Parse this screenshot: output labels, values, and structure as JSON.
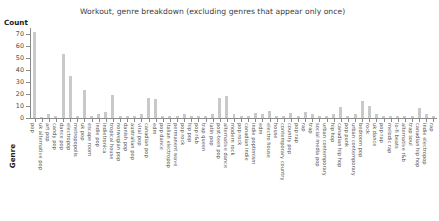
{
  "chart_data": {
    "type": "bar",
    "title": "Workout, genre breakdown (excluding genres that appear only once)",
    "xlabel": "Genre",
    "ylabel": "Count",
    "ylim": [
      0,
      75
    ],
    "yticks": [
      0,
      10,
      20,
      30,
      40,
      50,
      60,
      70
    ],
    "grid": false,
    "legend": null,
    "bar_color": "#c9c9c9",
    "categories": [
      "pop",
      "uk alternative pop",
      "art pop",
      "candy pop",
      "dance pop",
      "electropop",
      "metropopolis",
      "uk pop",
      "escape room",
      "indie pop",
      "indietronica",
      "tropical house",
      "norwegian pop",
      "danish pop",
      "australian pop",
      "viral pop",
      "canadian pop",
      "edm",
      "pop dance",
      "italian electropop",
      "permanent wave",
      "pop rock",
      "hip pop",
      "pop r&b",
      "trap queen",
      "latin pop",
      "post-teen pop",
      "alternative dance",
      "modern rock",
      "pop rock",
      "canadian indie",
      "indie poptimism",
      "edm",
      "electro house",
      "house",
      "contemporary country",
      "country pop",
      "pop rap",
      "rap",
      "trap",
      "social media pop",
      "urban contemporary",
      "hip hop",
      "canadian hip hop",
      "pop punk",
      "urban contemporary",
      "bedroom pop",
      "rock",
      "uk dance",
      "pop rap",
      "melodic rap",
      "lo-fi beats",
      "alternative r&b",
      "trap soul",
      "canadian hip hop",
      "indie electropop",
      "rap"
    ],
    "values": [
      72,
      1,
      3,
      2,
      53,
      35,
      2,
      23,
      2,
      3,
      5,
      19,
      2,
      2,
      2,
      3,
      17,
      16,
      2,
      2,
      2,
      3,
      2,
      2,
      2,
      3,
      17,
      18,
      3,
      2,
      2,
      4,
      3,
      6,
      2,
      2,
      4,
      2,
      5,
      3,
      2,
      2,
      3,
      9,
      2,
      3,
      14,
      10,
      3,
      2,
      2,
      2,
      2,
      2,
      8,
      3,
      2
    ]
  }
}
